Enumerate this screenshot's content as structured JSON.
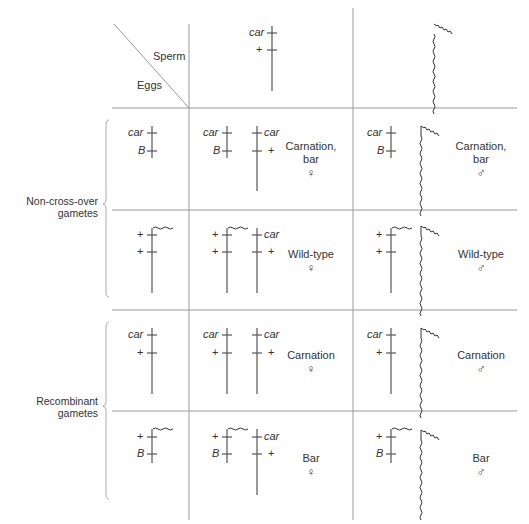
{
  "header": {
    "sperm_label": "Sperm",
    "eggs_label": "Eggs",
    "sperm_x_gamete": {
      "alleles": [
        "car",
        "+"
      ]
    },
    "sperm_y_gamete": {
      "chromosome": "Y"
    }
  },
  "groups": [
    {
      "label_line1": "Non-cross-over",
      "label_line2": "gametes"
    },
    {
      "label_line1": "Recombinant",
      "label_line2": "gametes"
    }
  ],
  "rows": [
    {
      "egg": {
        "alleles": [
          "car",
          "B"
        ]
      },
      "female": {
        "phenotype_line1": "Carnation,",
        "phenotype_line2": "bar",
        "symbol": "♀"
      },
      "male": {
        "phenotype_line1": "Carnation,",
        "phenotype_line2": "bar",
        "symbol": "♂"
      }
    },
    {
      "egg": {
        "alleles": [
          "+",
          "+"
        ]
      },
      "female": {
        "phenotype_line1": "Wild-type",
        "phenotype_line2": "",
        "symbol": "♀"
      },
      "male": {
        "phenotype_line1": "Wild-type",
        "phenotype_line2": "",
        "symbol": "♂"
      }
    },
    {
      "egg": {
        "alleles": [
          "car",
          "+"
        ]
      },
      "female": {
        "phenotype_line1": "Carnation",
        "phenotype_line2": "",
        "symbol": "♀"
      },
      "male": {
        "phenotype_line1": "Carnation",
        "phenotype_line2": "",
        "symbol": "♂"
      }
    },
    {
      "egg": {
        "alleles": [
          "+",
          "B"
        ]
      },
      "female": {
        "phenotype_line1": "Bar",
        "phenotype_line2": "",
        "symbol": "♀"
      },
      "male": {
        "phenotype_line1": "Bar",
        "phenotype_line2": "",
        "symbol": "♂"
      }
    }
  ],
  "sperm_allele_labels": {
    "x_top": "car",
    "x_bottom": "+"
  },
  "colors": {
    "line": "#555555",
    "grid": "#9a9a9a",
    "text": "#333333"
  }
}
